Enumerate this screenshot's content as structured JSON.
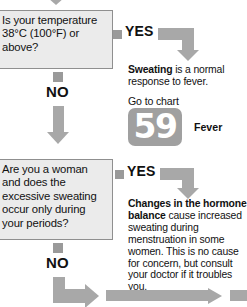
{
  "flowchart": {
    "title": "Excessive sweating decision flowchart",
    "accent_gray": "#a8a8a8",
    "box_fill": "#ebebeb",
    "box_border": "#8f8f8f",
    "badge_fill": "#a0a0a0"
  },
  "questions": [
    {
      "id": "fever",
      "text": "Is your temperature 38°C (100°F) or above?",
      "yes_label": "YES",
      "no_label": "NO"
    },
    {
      "id": "periods",
      "text": "Are you a woman and does the excessive sweating occur only during your periods?",
      "yes_label": "YES",
      "no_label": "NO"
    }
  ],
  "answers": [
    {
      "id": "fever-answer",
      "lead": "Sweating",
      "body": " is a normal response to fever.",
      "goto_label": "Go to chart",
      "chart_number": "59",
      "chart_name": "Fever"
    },
    {
      "id": "periods-answer",
      "lead": "Changes in the hormone balance",
      "body": " cause increased sweating during menstruation in some women. This is no cause for concern, but consult your doctor if it troubles you."
    }
  ]
}
